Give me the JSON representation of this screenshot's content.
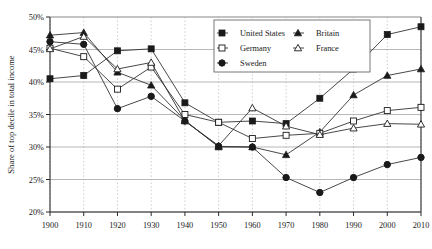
{
  "chart_data": {
    "type": "line",
    "title": "",
    "subtitle": "",
    "xlabel": "",
    "ylabel": "Share of top decile in total income",
    "x": [
      1900,
      1910,
      1920,
      1930,
      1940,
      1950,
      1960,
      1970,
      1980,
      1990,
      2000,
      2010
    ],
    "xticklabels": [
      "1900",
      "1910",
      "1920",
      "1930",
      "1940",
      "1950",
      "1960",
      "1970",
      "1980",
      "1990",
      "2000",
      "2010"
    ],
    "yticklabels": [
      "20%",
      "25%",
      "30%",
      "35%",
      "40%",
      "45%",
      "50%"
    ],
    "yticks": [
      20,
      25,
      30,
      35,
      40,
      45,
      50
    ],
    "ylim": [
      20,
      50
    ],
    "xlim": [
      1900,
      2010
    ],
    "grid": "both",
    "legend_position": "top-right",
    "series": [
      {
        "name": "United States",
        "marker": "filled-square",
        "values": [
          40.5,
          41.0,
          44.8,
          45.1,
          36.8,
          33.8,
          34.0,
          33.6,
          37.5,
          42.0,
          47.3,
          48.5
        ]
      },
      {
        "name": "Britain",
        "marker": "filled-triangle",
        "values": [
          47.2,
          47.6,
          41.5,
          39.5,
          34.1,
          30.0,
          30.0,
          28.8,
          32.3,
          38.0,
          41.0,
          42.0
        ]
      },
      {
        "name": "Germany",
        "marker": "open-square",
        "values": [
          45.2,
          43.9,
          38.9,
          42.3,
          35.0,
          33.8,
          31.3,
          31.8,
          32.1,
          34.0,
          35.6,
          36.1
        ]
      },
      {
        "name": "France",
        "marker": "open-triangle",
        "values": [
          45.1,
          47.0,
          42.0,
          43.0,
          34.0,
          30.2,
          36.0,
          33.2,
          31.9,
          32.9,
          33.6,
          33.5
        ]
      },
      {
        "name": "Sweden",
        "marker": "filled-circle",
        "values": [
          46.2,
          45.8,
          35.9,
          37.8,
          34.0,
          30.1,
          30.0,
          25.3,
          23.0,
          25.3,
          27.3,
          28.4
        ]
      }
    ]
  },
  "legend": {
    "entries": [
      {
        "label": "United States",
        "marker": "filled-square"
      },
      {
        "label": "Britain",
        "marker": "filled-triangle"
      },
      {
        "label": "Germany",
        "marker": "open-square"
      },
      {
        "label": "France",
        "marker": "open-triangle"
      },
      {
        "label": "Sweden",
        "marker": "filled-circle"
      }
    ]
  }
}
